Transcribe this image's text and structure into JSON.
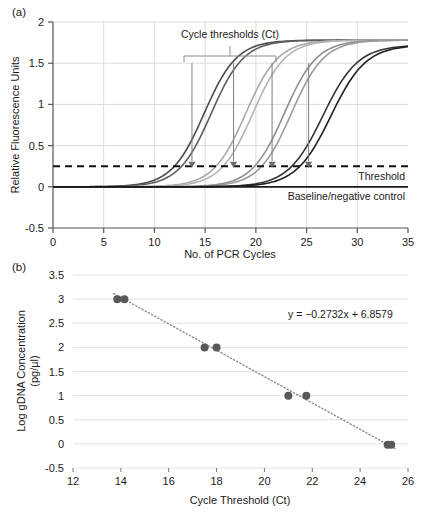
{
  "figure": {
    "panels": [
      {
        "letter": "(a)",
        "chart_data": {
          "type": "line",
          "title": "",
          "xlabel": "No. of PCR Cycles",
          "ylabel": "Relative Fluorescence Units",
          "xlim": [
            0,
            35
          ],
          "ylim": [
            -0.5,
            2
          ],
          "xticks": [
            "0",
            "5",
            "10",
            "15",
            "20",
            "25",
            "30",
            "35"
          ],
          "yticks": [
            "-0.5",
            "0",
            "0.5",
            "1",
            "1.5",
            "2"
          ],
          "grid": true,
          "legend": "none",
          "annotations": [
            {
              "name": "cycle-thresholds-bracket-label",
              "text": "Cycle thresholds (Ct)",
              "x": 19.4,
              "y": 1.93
            },
            {
              "name": "threshold-line-label",
              "text": "Threshold",
              "x": 33.6,
              "y": 0.1
            },
            {
              "name": "baseline-label",
              "text": "Baseline/negative control",
              "x": 33.6,
              "y": -0.12
            }
          ],
          "threshold_value": 0.25,
          "baseline_value": 0.0,
          "ct_markers": [
            13.7,
            17.8,
            21.6,
            25.2
          ],
          "series": [
            {
              "name": "replicate-1a",
              "ct": 14.9,
              "plateau": 1.78,
              "steepness": 0.62,
              "color": "#4a4a4a"
            },
            {
              "name": "replicate-1b",
              "ct": 15.6,
              "plateau": 1.78,
              "steepness": 0.62,
              "color": "#5d5d5d"
            },
            {
              "name": "replicate-2a",
              "ct": 19.0,
              "plateau": 1.78,
              "steepness": 0.62,
              "color": "#a8a8a8"
            },
            {
              "name": "replicate-2b",
              "ct": 19.7,
              "plateau": 1.78,
              "steepness": 0.62,
              "color": "#b4b4b4"
            },
            {
              "name": "replicate-3a",
              "ct": 22.8,
              "plateau": 1.78,
              "steepness": 0.62,
              "color": "#8f8f8f"
            },
            {
              "name": "replicate-3b",
              "ct": 23.5,
              "plateau": 1.78,
              "steepness": 0.62,
              "color": "#9b9b9b"
            },
            {
              "name": "replicate-4a",
              "ct": 26.6,
              "plateau": 1.72,
              "steepness": 0.58,
              "color": "#333333"
            },
            {
              "name": "replicate-4b",
              "ct": 27.4,
              "plateau": 1.72,
              "steepness": 0.58,
              "color": "#1f1f1f"
            }
          ]
        }
      },
      {
        "letter": "(b)",
        "chart_data": {
          "type": "scatter",
          "title": "",
          "xlabel": "Cycle Threshold (Ct)",
          "ylabel_line1": "Log gDNA Concentration",
          "ylabel_line2": "(pg/µl)",
          "xlim": [
            12,
            26
          ],
          "ylim": [
            -0.5,
            3.5
          ],
          "xticks": [
            "12",
            "14",
            "16",
            "18",
            "20",
            "22",
            "24",
            "26"
          ],
          "yticks": [
            "-0.5",
            "0",
            "0.5",
            "1",
            "1.5",
            "2",
            "2.5",
            "3",
            "3.5"
          ],
          "grid": true,
          "legend": "none",
          "equation": "y = −0.2732x + 6.8579",
          "slope": -0.2732,
          "intercept": 6.8579,
          "marker_color": "#595959",
          "trendline_style": "dotted",
          "points": [
            {
              "x": 13.85,
              "y": 3.0
            },
            {
              "x": 14.15,
              "y": 3.0
            },
            {
              "x": 17.5,
              "y": 2.0
            },
            {
              "x": 18.0,
              "y": 2.0
            },
            {
              "x": 21.0,
              "y": 1.0
            },
            {
              "x": 21.75,
              "y": 1.0
            },
            {
              "x": 25.15,
              "y": -0.02
            },
            {
              "x": 25.3,
              "y": -0.02
            }
          ]
        }
      }
    ]
  }
}
